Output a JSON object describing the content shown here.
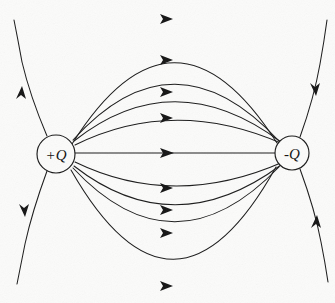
{
  "figure": {
    "type": "field-line-diagram",
    "width": 335,
    "height": 303,
    "background_color": "#fbfbfa",
    "line_color": "#1a1a1a"
  },
  "charges": [
    {
      "id": "positive-charge",
      "label": "+Q",
      "sign": "+",
      "cx": 56,
      "cy": 154,
      "r": 19,
      "role": "source"
    },
    {
      "id": "negative-charge",
      "label": "-Q",
      "sign": "-",
      "cx": 292,
      "cy": 153,
      "r": 17,
      "role": "sink"
    }
  ],
  "connecting_lines": [
    {
      "id": "arc-up-4",
      "sagitta": -140,
      "arrow_at": 0.5,
      "arrow_dir": "right"
    },
    {
      "id": "arc-up-3",
      "sagitta": -96,
      "arrow_at": 0.5,
      "arrow_dir": "right"
    },
    {
      "id": "arc-up-2",
      "sagitta": -60,
      "arrow_at": 0.5,
      "arrow_dir": "right"
    },
    {
      "id": "arc-up-1",
      "sagitta": -30,
      "arrow_at": 0.5,
      "arrow_dir": "right"
    },
    {
      "id": "arc-straight",
      "sagitta": 0,
      "arrow_at": 0.5,
      "arrow_dir": "right"
    },
    {
      "id": "arc-down-1",
      "sagitta": 30,
      "arrow_at": 0.5,
      "arrow_dir": "right"
    },
    {
      "id": "arc-down-2",
      "sagitta": 60,
      "arrow_at": 0.5,
      "arrow_dir": "right"
    },
    {
      "id": "arc-down-3",
      "sagitta": 96,
      "arrow_at": 0.5,
      "arrow_dir": "right"
    },
    {
      "id": "arc-down-4",
      "sagitta": 134,
      "arrow_at": 0.5,
      "arrow_dir": "right"
    }
  ],
  "escape_lines": [
    {
      "id": "escape-upper-left",
      "from": "positive-charge",
      "direction": "up-left",
      "arrow_dir": "outward"
    },
    {
      "id": "escape-lower-left",
      "from": "positive-charge",
      "direction": "down-left",
      "arrow_dir": "outward"
    },
    {
      "id": "escape-upper-right",
      "to": "negative-charge",
      "direction": "up-right",
      "arrow_dir": "inward"
    },
    {
      "id": "escape-lower-right",
      "to": "negative-charge",
      "direction": "down-right",
      "arrow_dir": "inward"
    }
  ],
  "annotations": {
    "flow_description": "Field lines originate on +Q and terminate on -Q",
    "arrow_count_midline": 9
  }
}
